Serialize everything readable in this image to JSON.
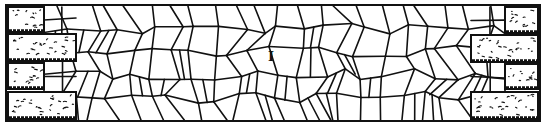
{
  "figure": {
    "label": "I",
    "label_position": [
      268,
      50
    ],
    "ink_color": "#111111",
    "paper_color": "#ffffff",
    "frame": {
      "x": 6,
      "y": 5,
      "w": 534,
      "h": 116
    },
    "bricks": [
      {
        "side": "left",
        "x": 8,
        "y": 7,
        "w": 36,
        "h": 25
      },
      {
        "side": "left",
        "x": 8,
        "y": 34,
        "w": 68,
        "h": 27
      },
      {
        "side": "left",
        "x": 8,
        "y": 63,
        "w": 36,
        "h": 26
      },
      {
        "side": "left",
        "x": 8,
        "y": 92,
        "w": 68,
        "h": 27
      },
      {
        "side": "right",
        "x": 505,
        "y": 7,
        "w": 33,
        "h": 26
      },
      {
        "side": "right",
        "x": 471,
        "y": 35,
        "w": 67,
        "h": 27
      },
      {
        "side": "right",
        "x": 505,
        "y": 64,
        "w": 33,
        "h": 25
      },
      {
        "side": "right",
        "x": 471,
        "y": 92,
        "w": 67,
        "h": 27
      }
    ]
  }
}
